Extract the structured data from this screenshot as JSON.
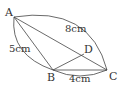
{
  "diagram": {
    "points": {
      "A": "A",
      "B": "B",
      "C": "C",
      "D": "D"
    },
    "measurements": {
      "AC": "8cm",
      "AB": "5cm",
      "BC": "4cm"
    }
  }
}
